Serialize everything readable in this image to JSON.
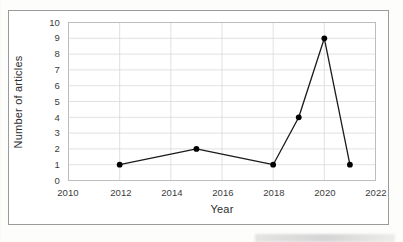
{
  "chart_data": {
    "type": "line",
    "title": "",
    "xlabel": "Year",
    "ylabel": "Number of articles",
    "x": [
      2012,
      2015,
      2018,
      2019,
      2020,
      2021
    ],
    "values": [
      1,
      2,
      1,
      4,
      9,
      1
    ],
    "series": [
      {
        "name": "Number of articles",
        "points": [
          {
            "x": 2012,
            "y": 1
          },
          {
            "x": 2015,
            "y": 2
          },
          {
            "x": 2018,
            "y": 1
          },
          {
            "x": 2019,
            "y": 4
          },
          {
            "x": 2020,
            "y": 9
          },
          {
            "x": 2021,
            "y": 1
          }
        ]
      }
    ],
    "xlim": [
      2010,
      2022
    ],
    "ylim": [
      0,
      10
    ],
    "xticks": [
      "2010",
      "2012",
      "2014",
      "2016",
      "2018",
      "2020",
      "2022"
    ],
    "yticks": [
      "0",
      "1",
      "2",
      "3",
      "4",
      "5",
      "6",
      "7",
      "8",
      "9",
      "10"
    ],
    "grid": true,
    "legend": false,
    "legend_position": "none",
    "marker": "filled-circle",
    "line_color": "#1a1a1a",
    "marker_color": "#000000",
    "grid_color": "#d9d9d9",
    "axis_color": "#b0b0b0"
  },
  "axes": {
    "y_title": "Number of articles",
    "x_title": "Year",
    "x_tick_labels": [
      "2010",
      "2012",
      "2014",
      "2016",
      "2018",
      "2020",
      "2022"
    ],
    "y_tick_labels": [
      "10",
      "9",
      "8",
      "7",
      "6",
      "5",
      "4",
      "3",
      "2",
      "1",
      "0"
    ]
  }
}
